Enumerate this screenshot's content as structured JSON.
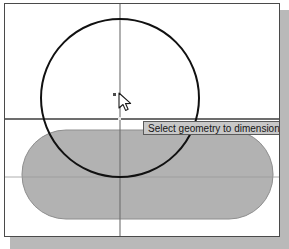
{
  "app": {
    "type": "cad-sketch-canvas",
    "background_color": "#ffffff",
    "frame_border_color": "#4a4a4a",
    "shadow_color": "#b9b9b9"
  },
  "tooltip": {
    "text": "Select geometry to dimension",
    "background_color": "#c8c8c8",
    "border_color": "#5a5a5a",
    "text_color": "#161616",
    "x": 138,
    "y": 117
  },
  "cursor": {
    "name": "arrow-pointer",
    "x": 112,
    "y": 88,
    "marker_visible": true
  },
  "geometry": {
    "construction_lines": [
      {
        "name": "horizontal-axis",
        "orientation": "horizontal",
        "y": 115,
        "color": "#3c3c3c",
        "weight": 1.3
      },
      {
        "name": "vertical-axis",
        "orientation": "vertical",
        "x": 115,
        "color": "#6e6e6e",
        "weight": 1.1
      },
      {
        "name": "slot-centerline",
        "orientation": "horizontal",
        "y": 173,
        "color": "#9a9a9a",
        "weight": 0.8
      }
    ],
    "circle": {
      "name": "sketch-circle",
      "center_x": 115,
      "center_y": 94,
      "radius": 79,
      "stroke_color": "#111111",
      "stroke_width": 2,
      "fill": "none"
    },
    "slot": {
      "name": "slot-profile",
      "shape": "stadium",
      "x": 17,
      "y": 126,
      "width": 251,
      "height": 89,
      "corner_radius": 44,
      "fill_color": "#b2b2b2",
      "stroke_color": "#8e8e8e",
      "stroke_width": 1
    }
  }
}
